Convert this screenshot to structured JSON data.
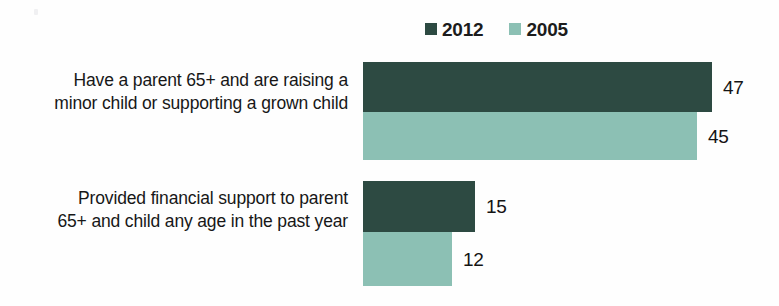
{
  "legend": {
    "entries": [
      {
        "label": "2012",
        "color": "#2d4a42",
        "swatch_icon": "legend-square-icon"
      },
      {
        "label": "2005",
        "color": "#8cc0b4",
        "swatch_icon": "legend-square-icon"
      }
    ]
  },
  "chart_data": {
    "type": "bar",
    "orientation": "horizontal",
    "title": "",
    "subtitle": "",
    "xlabel": "",
    "ylabel": "",
    "grid": false,
    "legend_position": "top-center",
    "xlim": [
      0,
      50
    ],
    "categories": [
      "Have a parent 65+ and are raising a minor child or supporting a grown child",
      "Provided financial support to parent 65+ and child any age in the past year"
    ],
    "series": [
      {
        "name": "2012",
        "color": "#2d4a42",
        "values": [
          47,
          15
        ]
      },
      {
        "name": "2005",
        "color": "#8cc0b4",
        "values": [
          45,
          12
        ]
      }
    ],
    "data_labels": [
      [
        "47",
        "45"
      ],
      [
        "15",
        "12"
      ]
    ]
  },
  "groups": [
    {
      "label": "Have a parent 65+ and are raising a minor child or supporting a grown child",
      "bars": [
        {
          "series": "2012",
          "value": 47,
          "label": "47",
          "width_px": 349,
          "color": "#2d4a42"
        },
        {
          "series": "2005",
          "value": 45,
          "label": "45",
          "width_px": 334,
          "color": "#8cc0b4"
        }
      ]
    },
    {
      "label": "Provided financial support to parent 65+ and child any age in the past year",
      "bars": [
        {
          "series": "2012",
          "value": 15,
          "label": "15",
          "width_px": 112,
          "color": "#2d4a42"
        },
        {
          "series": "2005",
          "value": 12,
          "label": "12",
          "width_px": 89,
          "color": "#8cc0b4"
        }
      ]
    }
  ]
}
